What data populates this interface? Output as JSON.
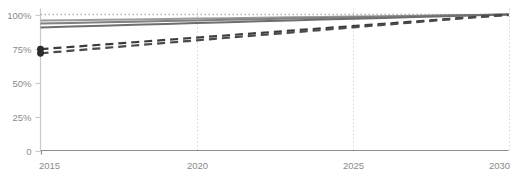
{
  "chart_data": {
    "type": "line",
    "title": "",
    "subtitle": "",
    "xlabel": "",
    "ylabel": "",
    "xlim": [
      2015,
      2030
    ],
    "ylim": [
      0,
      100
    ],
    "grid": "vertical-dotted",
    "legend": "none",
    "x": [
      2015,
      2016,
      2017,
      2018,
      2019,
      2020,
      2021,
      2022,
      2023,
      2024,
      2025,
      2026,
      2027,
      2028,
      2029,
      2030
    ],
    "y_ticks": [
      0,
      25,
      50,
      75,
      100
    ],
    "y_tick_labels": [
      "0",
      "25%",
      "50%",
      "75%",
      "100%"
    ],
    "x_ticks": [
      2015,
      2020,
      2025,
      2030
    ],
    "x_tick_labels": [
      "2015",
      "2020",
      "2025",
      "2030"
    ],
    "series": [
      {
        "name": "reference-target",
        "style": "dotted",
        "color": "#b0b0b0",
        "width": 1.4,
        "values": [
          100,
          100,
          100,
          100,
          100,
          100,
          100,
          100,
          100,
          100,
          100,
          100,
          100,
          100,
          100,
          100
        ]
      },
      {
        "name": "solid-upper",
        "style": "solid",
        "color": "#9a9a9a",
        "width": 2.0,
        "values": [
          95.5,
          95.8,
          96.1,
          96.4,
          96.7,
          97.0,
          97.3,
          97.6,
          97.9,
          98.2,
          98.5,
          98.8,
          99.1,
          99.4,
          99.7,
          100.0
        ]
      },
      {
        "name": "solid-middle",
        "style": "solid",
        "color": "#808080",
        "width": 2.0,
        "values": [
          93.4,
          93.8,
          94.3,
          94.7,
          95.2,
          95.6,
          96.1,
          96.5,
          97.0,
          97.4,
          97.9,
          98.3,
          98.8,
          99.2,
          99.6,
          100.0
        ]
      },
      {
        "name": "solid-lower",
        "style": "solid",
        "color": "#6e6e6e",
        "width": 2.0,
        "values": [
          90.5,
          91.1,
          91.7,
          92.4,
          93.0,
          93.7,
          94.3,
          95.0,
          95.6,
          96.3,
          96.9,
          97.5,
          98.1,
          98.8,
          99.4,
          100.0
        ]
      },
      {
        "name": "dashed-upper",
        "style": "dashed",
        "color": "#3c3c3c",
        "width": 2.2,
        "values": [
          74.5,
          76.2,
          77.9,
          79.6,
          81.3,
          83.0,
          84.7,
          86.4,
          88.1,
          89.8,
          91.5,
          93.2,
          94.9,
          96.6,
          98.3,
          99.8
        ]
      },
      {
        "name": "dashed-lower",
        "style": "dashed",
        "color": "#4a4a4a",
        "width": 2.2,
        "values": [
          71.5,
          73.4,
          75.3,
          77.2,
          79.1,
          81.0,
          82.9,
          84.8,
          86.7,
          88.6,
          90.5,
          92.4,
          94.3,
          96.2,
          98.1,
          99.6
        ]
      }
    ],
    "markers": [
      {
        "name": "marker-2015-a",
        "x": 2015,
        "y": 74.5,
        "color": "#2b2b2b",
        "r": 3.4
      },
      {
        "name": "marker-2015-b",
        "x": 2015,
        "y": 71.5,
        "color": "#2b2b2b",
        "r": 3.4
      }
    ],
    "axis_color": "#c9c9c9",
    "gridline_color": "#cccccc",
    "tick_label_color": "#8a8a8a"
  }
}
